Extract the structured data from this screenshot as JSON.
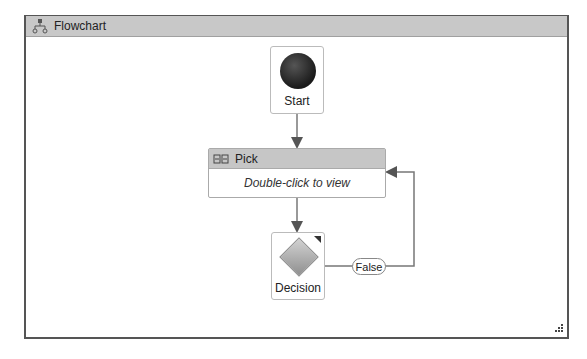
{
  "designer": {
    "title": "Flowchart",
    "title_icon": "flowchart-icon"
  },
  "nodes": {
    "start": {
      "label": "Start",
      "icon": "start-node-ball"
    },
    "pick": {
      "title": "Pick",
      "body": "Double-click to view",
      "icon": "pick-icon"
    },
    "decision": {
      "label": "Decision",
      "icon": "decision-diamond-icon"
    }
  },
  "connectors": {
    "false_label": "False"
  },
  "colors": {
    "header_bg": "#c8c8c8",
    "frame_border": "#555555",
    "connector": "#777777"
  }
}
